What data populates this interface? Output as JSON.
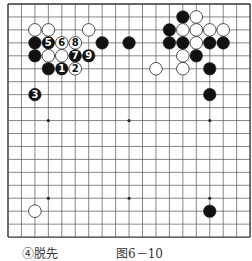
{
  "board": {
    "size": 19,
    "origin_x": 8,
    "origin_y": 4,
    "spacing_x": 13.45,
    "spacing_y": 12.95,
    "stone_radius": 6.3,
    "line_color": "#555555",
    "border_color": "#333333",
    "black_color": "#111111",
    "white_color": "#ffffff",
    "star_points": [
      [
        3,
        3
      ],
      [
        9,
        3
      ],
      [
        15,
        3
      ],
      [
        3,
        9
      ],
      [
        9,
        9
      ],
      [
        15,
        9
      ],
      [
        3,
        15
      ],
      [
        9,
        15
      ],
      [
        15,
        15
      ]
    ],
    "stones": [
      {
        "c": 2,
        "r": 2,
        "color": "white"
      },
      {
        "c": 3,
        "r": 2,
        "color": "white"
      },
      {
        "c": 6,
        "r": 2,
        "color": "white"
      },
      {
        "c": 2,
        "r": 3,
        "color": "black"
      },
      {
        "c": 3,
        "r": 3,
        "color": "black",
        "label": "5"
      },
      {
        "c": 4,
        "r": 3,
        "color": "white",
        "label": "6"
      },
      {
        "c": 5,
        "r": 3,
        "color": "white",
        "label": "8"
      },
      {
        "c": 7,
        "r": 3,
        "color": "black"
      },
      {
        "c": 9,
        "r": 3,
        "color": "black"
      },
      {
        "c": 2,
        "r": 4,
        "color": "black"
      },
      {
        "c": 3,
        "r": 4,
        "color": "white"
      },
      {
        "c": 4,
        "r": 4,
        "color": "white"
      },
      {
        "c": 5,
        "r": 4,
        "color": "black",
        "label": "7"
      },
      {
        "c": 6,
        "r": 4,
        "color": "black",
        "label": "9"
      },
      {
        "c": 3,
        "r": 5,
        "color": "black"
      },
      {
        "c": 4,
        "r": 5,
        "color": "black",
        "label": "1"
      },
      {
        "c": 5,
        "r": 5,
        "color": "white",
        "label": "2"
      },
      {
        "c": 2,
        "r": 7,
        "color": "black",
        "label": "3"
      },
      {
        "c": 13,
        "r": 1,
        "color": "black"
      },
      {
        "c": 14,
        "r": 1,
        "color": "white"
      },
      {
        "c": 12,
        "r": 2,
        "color": "black"
      },
      {
        "c": 13,
        "r": 2,
        "color": "white"
      },
      {
        "c": 14,
        "r": 2,
        "color": "white"
      },
      {
        "c": 15,
        "r": 2,
        "color": "white"
      },
      {
        "c": 16,
        "r": 2,
        "color": "white"
      },
      {
        "c": 12,
        "r": 3,
        "color": "black"
      },
      {
        "c": 13,
        "r": 3,
        "color": "black"
      },
      {
        "c": 14,
        "r": 3,
        "color": "white"
      },
      {
        "c": 15,
        "r": 3,
        "color": "black"
      },
      {
        "c": 16,
        "r": 3,
        "color": "black"
      },
      {
        "c": 13,
        "r": 4,
        "color": "white"
      },
      {
        "c": 14,
        "r": 4,
        "color": "black"
      },
      {
        "c": 11,
        "r": 5,
        "color": "white"
      },
      {
        "c": 13,
        "r": 5,
        "color": "white"
      },
      {
        "c": 15,
        "r": 5,
        "color": "black"
      },
      {
        "c": 15,
        "r": 7,
        "color": "black"
      },
      {
        "c": 2,
        "r": 16,
        "color": "white"
      },
      {
        "c": 15,
        "r": 16,
        "color": "black"
      }
    ]
  },
  "captions": {
    "move_note": "④脱先",
    "figure_label": "图6－10"
  }
}
